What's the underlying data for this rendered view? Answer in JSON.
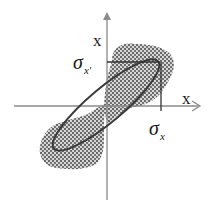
{
  "diagram": {
    "type": "phase-space ellipse",
    "vertical_axis_label": "x'",
    "vertical_axis_label_display": "x",
    "horizontal_axis_label": "x",
    "sigma_vertical": {
      "symbol": "σ",
      "subscript": "x'"
    },
    "sigma_horizontal": {
      "symbol": "σ",
      "subscript": "x"
    },
    "elements": [
      "horizontal axis with arrow",
      "vertical axis with arrow",
      "tilted ellipse",
      "stippled particle distribution (two lobes)",
      "projection lines"
    ]
  },
  "colors": {
    "axis": "#8a8a8a",
    "ellipse": "#3a3a3a",
    "stipple": "#555555",
    "text": "#1a1a1a"
  }
}
